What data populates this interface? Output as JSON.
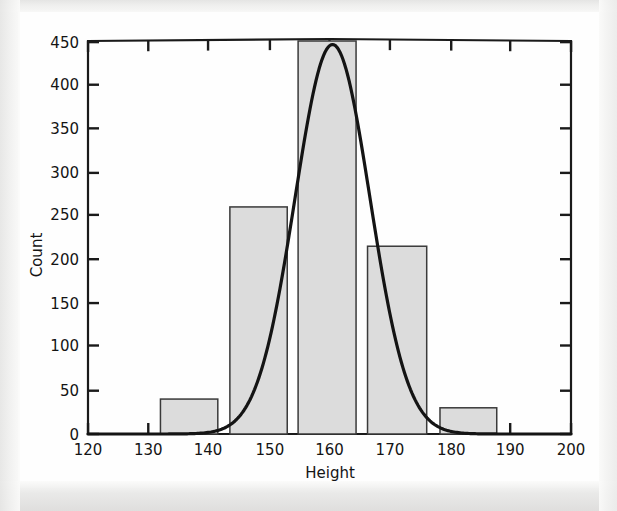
{
  "figure": {
    "background_color": "#fefefe",
    "page_color": "#f2f2f1",
    "ink_color": "#141414",
    "bar_fill_color": "#dcdcdc",
    "bar_edge_color": "#3a3a3a",
    "curve_color": "#141414"
  },
  "axes": {
    "x_title": "Height",
    "y_title": "Count",
    "x_ticks": [
      "120",
      "130",
      "140",
      "150",
      "160",
      "170",
      "180",
      "190",
      "200"
    ],
    "y_ticks": [
      "0",
      "50",
      "100",
      "150",
      "200",
      "250",
      "300",
      "350",
      "400",
      "450"
    ]
  },
  "chart_data": {
    "type": "bar",
    "title": "",
    "subtitle": "",
    "xlabel": "Height",
    "ylabel": "Count",
    "xlim": [
      120,
      200
    ],
    "ylim": [
      0,
      450
    ],
    "xticks": [
      120,
      130,
      140,
      150,
      160,
      170,
      180,
      190,
      200
    ],
    "yticks": [
      0,
      50,
      100,
      150,
      200,
      250,
      300,
      350,
      400,
      450
    ],
    "grid": false,
    "legend": false,
    "legend_position": "none",
    "bars": [
      {
        "label": "132-141",
        "x_start": 132.0,
        "x_end": 141.5,
        "value": 40
      },
      {
        "label": "143-153",
        "x_start": 143.5,
        "x_end": 153.0,
        "value": 260
      },
      {
        "label": "155-164",
        "x_start": 154.8,
        "x_end": 164.4,
        "value": 450
      },
      {
        "label": "166-176",
        "x_start": 166.3,
        "x_end": 176.1,
        "value": 215
      },
      {
        "label": "178-188",
        "x_start": 178.3,
        "x_end": 187.7,
        "value": 30
      }
    ],
    "categories": [
      "132-141",
      "143-153",
      "155-164",
      "166-176",
      "178-188"
    ],
    "values": [
      40,
      260,
      450,
      215,
      30
    ],
    "overlay_curve": {
      "name": "normal-fit",
      "type": "gaussian",
      "mean": 160.5,
      "sigma": 6.2,
      "peak": 446,
      "note": "smooth bell curve overlaid on the histogram"
    }
  }
}
